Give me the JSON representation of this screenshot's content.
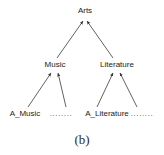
{
  "figure": {
    "caption": "(b)",
    "edge_color": "#3a3a3a",
    "text_color": "#1a1a1a",
    "background": "#ffffff"
  },
  "nodes": {
    "root": {
      "label": "Arts",
      "x": 85,
      "y": 11
    },
    "level2": [
      {
        "label": "Music",
        "x": 55,
        "y": 65
      },
      {
        "label": "Literature",
        "x": 117,
        "y": 65
      }
    ],
    "leaves": [
      {
        "label": "A_Music",
        "x": 25,
        "y": 114
      },
      {
        "label": "........",
        "x": 61,
        "y": 114
      },
      {
        "label": "A_Literature",
        "x": 107,
        "y": 114
      },
      {
        "label": "........",
        "x": 142,
        "y": 114
      }
    ]
  },
  "edges": [
    {
      "from": "Music",
      "to": "Arts",
      "x1": 57,
      "y1": 58,
      "x2": 83,
      "y2": 21
    },
    {
      "from": "Literature",
      "to": "Arts",
      "x1": 113,
      "y1": 58,
      "x2": 87,
      "y2": 21
    },
    {
      "from": "A_Music",
      "to": "Music",
      "x1": 28,
      "y1": 107,
      "x2": 51,
      "y2": 73
    },
    {
      "from": "ellipsis-left",
      "to": "Music",
      "x1": 66,
      "y1": 107,
      "x2": 58,
      "y2": 73
    },
    {
      "from": "A_Literature",
      "to": "Literature",
      "x1": 97,
      "y1": 107,
      "x2": 113,
      "y2": 73
    },
    {
      "from": "ellipsis-right",
      "to": "Literature",
      "x1": 137,
      "y1": 107,
      "x2": 120,
      "y2": 73
    }
  ]
}
